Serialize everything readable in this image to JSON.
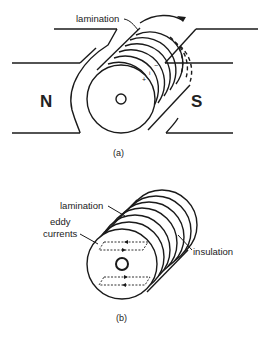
{
  "figure_a": {
    "caption": "(a)",
    "label_lamination": "lamination",
    "pole_north": "N",
    "pole_south": "S",
    "plus_sign": "+",
    "minus_sign": "−",
    "current_symbol": "i"
  },
  "figure_b": {
    "caption": "(b)",
    "label_lamination": "lamination",
    "label_eddy_line1": "eddy",
    "label_eddy_line2": "currents",
    "label_insulation": "insulation"
  },
  "colors": {
    "stroke": "#1a1a1a",
    "background": "#ffffff"
  }
}
